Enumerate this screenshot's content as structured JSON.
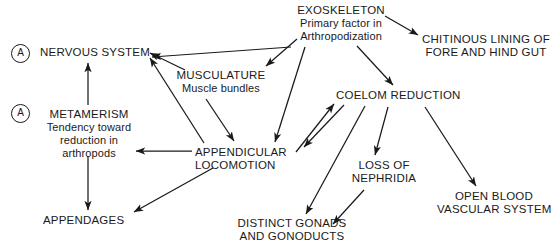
{
  "diagram": {
    "type": "flow-diagram",
    "background_color": "#ffffff",
    "line_color": "#1a1a1a",
    "text_color": "#1a1a1a",
    "tags": [
      {
        "id": "tag-a-nervous",
        "label": "A"
      },
      {
        "id": "tag-a-metamerism",
        "label": "A"
      }
    ],
    "nodes": [
      {
        "id": "nervous-system",
        "lines": [
          "NERVOUS SYSTEM"
        ],
        "x": 40,
        "y": 46,
        "width": 108
      },
      {
        "id": "metamerism",
        "lines": [
          "METAMERISM"
        ],
        "sublines": [
          "Tendency toward",
          "reduction in",
          "arthropods"
        ],
        "x": 36,
        "y": 108,
        "width": 106
      },
      {
        "id": "appendages",
        "lines": [
          "APPENDAGES"
        ],
        "x": 43,
        "y": 214,
        "width": 80
      },
      {
        "id": "musculature",
        "lines": [
          "MUSCULATURE"
        ],
        "sublines": [
          "Muscle bundles"
        ],
        "x": 176,
        "y": 69,
        "width": 90
      },
      {
        "id": "appendicular-locomotion",
        "lines": [
          "APPENDICULAR",
          "LOCOMOTION"
        ],
        "x": 195,
        "y": 146,
        "width": 100
      },
      {
        "id": "exoskeleton",
        "lines": [
          "EXOSKELETON"
        ],
        "sublines": [
          "Primary factor in",
          "Arthropodization"
        ],
        "x": 285,
        "y": 4,
        "width": 112
      },
      {
        "id": "chitinous-lining",
        "lines": [
          "CHITINOUS LINING OF",
          "FORE AND HIND GUT"
        ],
        "x": 421,
        "y": 33,
        "width": 130
      },
      {
        "id": "coelom-reduction",
        "lines": [
          "COELOM REDUCTION"
        ],
        "x": 336,
        "y": 89,
        "width": 122
      },
      {
        "id": "loss-of-nephridia",
        "lines": [
          "LOSS OF",
          "NEPHRIDIA"
        ],
        "x": 344,
        "y": 159,
        "width": 80
      },
      {
        "id": "distinct-gonads",
        "lines": [
          "DISTINCT GONADS",
          "AND GONODUCTS"
        ],
        "x": 235,
        "y": 217,
        "width": 114
      },
      {
        "id": "open-blood-vascular",
        "lines": [
          "OPEN BLOOD",
          "VASCULAR SYSTEM"
        ],
        "x": 437,
        "y": 190,
        "width": 114
      }
    ],
    "edges": [
      {
        "id": "edge-exoskeleton-to-musculature",
        "from": "exoskeleton",
        "to": "musculature",
        "d": "M 297 39 L 266 66"
      },
      {
        "id": "edge-exoskeleton-to-chitinous",
        "from": "exoskeleton",
        "to": "chitinous-lining",
        "d": "M 385 16 L 418 35"
      },
      {
        "id": "edge-exoskeleton-to-coelom",
        "from": "exoskeleton",
        "to": "coelom-reduction",
        "d": "M 357 46 L 393 85"
      },
      {
        "id": "edge-exoskeleton-to-appendicular",
        "from": "exoskeleton",
        "to": "appendicular-locomotion",
        "d": "M 305 47 L 275 142"
      },
      {
        "id": "edge-exoskeleton-to-nervous-long",
        "from": "exoskeleton",
        "to": "nervous-system",
        "d": "M 291 47 L 152 57"
      },
      {
        "id": "edge-musculature-to-nervous",
        "from": "musculature",
        "to": "nervous-system",
        "d": "M 185 70 L 150 53"
      },
      {
        "id": "edge-musculature-to-appendicular",
        "from": "musculature",
        "to": "appendicular-locomotion",
        "d": "M 206 99 L 234 141"
      },
      {
        "id": "edge-appendicular-to-nervous",
        "from": "appendicular-locomotion",
        "to": "nervous-system",
        "d": "M 204 143 L 150 58"
      },
      {
        "id": "edge-appendicular-to-metamerism",
        "from": "appendicular-locomotion",
        "to": "metamerism",
        "d": "M 192 151 L 136 151"
      },
      {
        "id": "edge-appendicular-to-appendages",
        "from": "appendicular-locomotion",
        "to": "appendages",
        "d": "M 213 168 L 134 212"
      },
      {
        "id": "edge-appendicular-to-coelom",
        "from": "appendicular-locomotion",
        "to": "coelom-reduction",
        "d": "M 296 152 L 334 104"
      },
      {
        "id": "edge-metamerism-to-nervous",
        "from": "metamerism",
        "to": "nervous-system",
        "d": "M 88 105 L 88 63"
      },
      {
        "id": "edge-metamerism-to-appendages",
        "from": "metamerism",
        "to": "appendages",
        "d": "M 88 156 L 88 210"
      },
      {
        "id": "edge-coelom-to-appendicular",
        "from": "coelom-reduction",
        "to": "appendicular-locomotion",
        "d": "M 344 105 L 304 147"
      },
      {
        "id": "edge-coelom-to-distinct-gonads",
        "from": "coelom-reduction",
        "to": "distinct-gonads",
        "d": "M 365 106 L 306 214"
      },
      {
        "id": "edge-coelom-to-loss-nephridia",
        "from": "coelom-reduction",
        "to": "loss-of-nephridia",
        "d": "M 388 107 L 375 155"
      },
      {
        "id": "edge-coelom-to-open-blood",
        "from": "coelom-reduction",
        "to": "open-blood-vascular",
        "d": "M 425 107 L 476 186"
      },
      {
        "id": "edge-nephridia-to-gonads",
        "from": "loss-of-nephridia",
        "to": "distinct-gonads",
        "d": "M 364 190 L 333 224"
      }
    ]
  }
}
